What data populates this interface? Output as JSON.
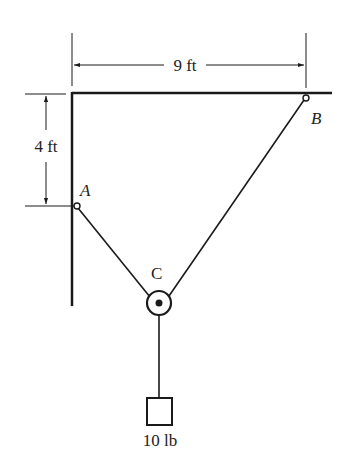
{
  "diagram": {
    "type": "statics-pulley",
    "dimensions": {
      "horizontal": "9 ft",
      "vertical": "4 ft"
    },
    "points": {
      "A": "A",
      "B": "B",
      "C": "C"
    },
    "load": "10 lb",
    "colors": {
      "line": "#1a1a1a",
      "background": "#ffffff"
    }
  }
}
